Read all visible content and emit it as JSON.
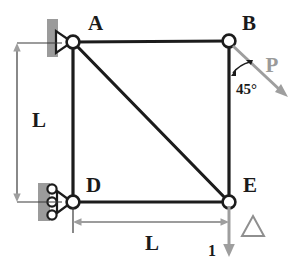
{
  "figure": {
    "background_color": "#ffffff",
    "member_color": "#1c1c1c",
    "load_color": "#9e9e9e",
    "support_color": "#9b9b9b"
  },
  "joints": [
    {
      "id": "A",
      "label": "A",
      "x": 73,
      "y": 42,
      "label_x": 88,
      "label_y": 30,
      "support": "pin"
    },
    {
      "id": "B",
      "label": "B",
      "x": 229,
      "y": 41,
      "label_x": 242,
      "label_y": 30,
      "support": "none"
    },
    {
      "id": "D",
      "label": "D",
      "x": 73,
      "y": 202,
      "label_x": 86,
      "label_y": 192,
      "support": "roller"
    },
    {
      "id": "E",
      "label": "E",
      "x": 229,
      "y": 202,
      "label_x": 243,
      "label_y": 192,
      "support": "none"
    }
  ],
  "members": [
    {
      "from": "A",
      "to": "B"
    },
    {
      "from": "B",
      "to": "E"
    },
    {
      "from": "D",
      "to": "E"
    },
    {
      "from": "A",
      "to": "D"
    },
    {
      "from": "A",
      "to": "E"
    }
  ],
  "dimensions": [
    {
      "name": "vertical",
      "label": "L",
      "label_x": 32,
      "label_y": 127,
      "from_x": 17,
      "from_y": 43,
      "to_x": 17,
      "to_y": 202
    },
    {
      "name": "horizontal",
      "label": "L",
      "label_x": 152,
      "label_y": 250,
      "from_x": 73,
      "from_y": 222,
      "to_x": 229,
      "to_y": 222
    }
  ],
  "loads": [
    {
      "name": "applied-load-P",
      "label": "P",
      "label_x": 272,
      "label_y": 72,
      "angle_label": "45°",
      "angle_label_x": 236,
      "angle_label_y": 88,
      "start_x": 231,
      "start_y": 44,
      "end_x": 286,
      "end_y": 96
    },
    {
      "name": "unit-virtual-load",
      "label": "1",
      "label_x": 216,
      "label_y": 256,
      "deflection_symbol": "Δ",
      "deflection_x": 253,
      "deflection_y": 232,
      "start_x": 229,
      "start_y": 204,
      "end_x": 229,
      "end_y": 255
    }
  ],
  "supports": {
    "pin": {
      "joint": "A",
      "name": "pin-support",
      "wall_x": 47,
      "wall_y": 19,
      "wall_w": 11,
      "wall_h": 38
    },
    "roller": {
      "joint": "D",
      "name": "roller-support",
      "wall_x": 38,
      "wall_y": 183,
      "wall_w": 12,
      "wall_h": 38,
      "roller_count": 3
    }
  }
}
